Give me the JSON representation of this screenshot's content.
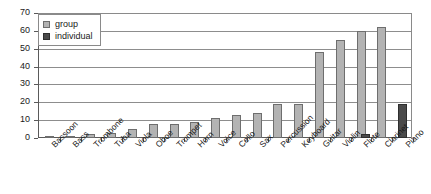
{
  "chart_data": {
    "type": "bar",
    "title": "",
    "xlabel": "",
    "ylabel": "",
    "ylim": [
      0,
      70
    ],
    "yticks": [
      0,
      10,
      20,
      30,
      40,
      50,
      60,
      70
    ],
    "grid": true,
    "legend_position": "top-left",
    "categories": [
      "Bassoon",
      "Bass",
      "Trombone",
      "Tuba",
      "Viola",
      "Oboe",
      "Trumpet",
      "Horn",
      "Voice",
      "Cello",
      "Sax",
      "Percussion",
      "Keyboard",
      "Guitar",
      "Violin",
      "Flute",
      "Clarinet",
      "Piano"
    ],
    "series": [
      {
        "name": "group",
        "color": "#b3b3b3",
        "values": [
          1,
          1,
          2,
          3,
          5,
          8,
          8,
          9,
          11,
          13,
          14,
          19,
          19,
          48,
          55,
          60,
          62,
          0
        ]
      },
      {
        "name": "individual",
        "color": "#4a4a4a",
        "values": [
          0,
          0,
          0,
          0,
          0,
          0,
          0,
          0,
          0,
          0,
          0,
          0,
          0,
          0,
          0,
          2,
          0,
          19
        ]
      }
    ]
  },
  "legend": {
    "items": [
      {
        "label": "group",
        "swatch": "group-swatch"
      },
      {
        "label": "individual",
        "swatch": "individual-swatch"
      }
    ]
  },
  "axis": {
    "y_tick_labels": [
      "70",
      "60",
      "50",
      "40",
      "30",
      "20",
      "10",
      "0"
    ]
  }
}
